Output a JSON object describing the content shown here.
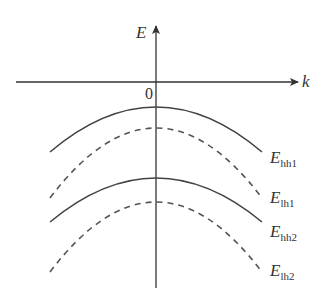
{
  "diagram": {
    "axes": {
      "vertical_label": "E",
      "horizontal_label": "k",
      "origin_label": "0"
    },
    "bands": [
      {
        "id": "hh1",
        "label_main": "E",
        "label_sub": "hh1",
        "style": "solid"
      },
      {
        "id": "lh1",
        "label_main": "E",
        "label_sub": "lh1",
        "style": "dashed"
      },
      {
        "id": "hh2",
        "label_main": "E",
        "label_sub": "hh2",
        "style": "solid"
      },
      {
        "id": "lh2",
        "label_main": "E",
        "label_sub": "lh2",
        "style": "dashed"
      }
    ]
  }
}
